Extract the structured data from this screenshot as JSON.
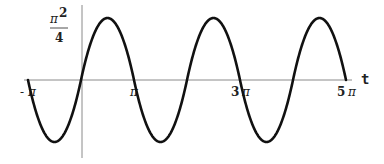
{
  "chart_data": {
    "type": "line",
    "title": "",
    "xlabel": "t",
    "ylabel": "",
    "xlim": [
      "-π",
      "5π"
    ],
    "ylim": [
      "-π²/4",
      "π²/4"
    ],
    "grid": false,
    "legend": null,
    "x_ticks": [
      {
        "value": "-π",
        "label_pre": "-",
        "label_pi": "π"
      },
      {
        "value": "π",
        "label_pre": "",
        "label_pi": "π"
      },
      {
        "value": "3π",
        "label_pre": "3 ",
        "label_pi": "π"
      },
      {
        "value": "5π",
        "label_pre": "5 ",
        "label_pi": "π"
      }
    ],
    "y_ticks": [
      {
        "value": "π²/4",
        "numerator": "π²",
        "denominator": "4"
      }
    ],
    "series": [
      {
        "name": "f(t)",
        "description": "Periodic odd function of period 2π, f(t)=t(π−t) on [0,π], extended oddly; zeros at multiples of π, peaks π²/4 at π/2+2kπ, troughs −π²/4 at 3π/2+2kπ",
        "x": [
          "-π",
          "-π/2",
          "0",
          "π/2",
          "π",
          "3π/2",
          "2π",
          "5π/2",
          "3π",
          "7π/2",
          "4π",
          "9π/2",
          "5π"
        ],
        "values": [
          0,
          -2.467,
          0,
          2.467,
          0,
          -2.467,
          0,
          2.467,
          0,
          -2.467,
          0,
          2.467,
          0
        ]
      }
    ]
  },
  "labels": {
    "x_axis": "t",
    "y_num": "π",
    "y_exp": "2",
    "y_den": "4",
    "tick_neg_pi_pre": "-",
    "tick_pi": "π",
    "tick_3pi_pre": "3",
    "tick_5pi_pre": "5"
  }
}
